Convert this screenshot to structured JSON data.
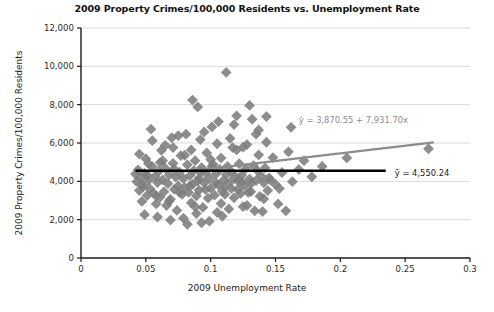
{
  "chart_data": {
    "type": "scatter",
    "title": "2009 Property Crimes/100,000 Residents vs. Unemployment Rate",
    "xlabel": "2009 Unemployment Rate",
    "ylabel": "2009 Property Crimes/100,000 Residents",
    "xlim": [
      0,
      0.3
    ],
    "ylim": [
      0,
      12000
    ],
    "xticks": [
      0,
      0.05,
      0.1,
      0.15,
      0.2,
      0.25,
      0.3
    ],
    "xtick_labels": [
      "0",
      "0.05",
      "0.1",
      "0.15",
      "0.2",
      "0.25",
      "0.3"
    ],
    "yticks": [
      0,
      2000,
      4000,
      6000,
      8000,
      10000,
      12000
    ],
    "ytick_labels": [
      "0",
      "2,000",
      "4,000",
      "6,000",
      "8,000",
      "10,000",
      "12,000"
    ],
    "grid": "horizontal",
    "legend": "none",
    "marker": "diamond",
    "marker_color": "#7d7d7d",
    "marker_size": 5.4,
    "regression_line": {
      "label": "ŷ = 3,870.55 + 7,931.70x",
      "intercept": 3870.55,
      "slope": 7931.7,
      "color": "#8c8c8c",
      "x_start": 0.085,
      "x_end": 0.272,
      "label_x": 0.168,
      "label_y": 7050
    },
    "mean_line": {
      "label": "ȳ = 4,550.24",
      "value": 4550.24,
      "color": "#000000",
      "x_start": 0.042,
      "x_end": 0.235,
      "label_x": 0.242,
      "label_y": 4300
    },
    "points": [
      [
        0.042,
        4380
      ],
      [
        0.043,
        3980
      ],
      [
        0.044,
        4600
      ],
      [
        0.045,
        3520
      ],
      [
        0.046,
        4180
      ],
      [
        0.047,
        2950
      ],
      [
        0.048,
        3720
      ],
      [
        0.049,
        4420
      ],
      [
        0.05,
        5180
      ],
      [
        0.051,
        3260
      ],
      [
        0.052,
        4050
      ],
      [
        0.053,
        3620
      ],
      [
        0.054,
        6720
      ],
      [
        0.055,
        4760
      ],
      [
        0.056,
        3380
      ],
      [
        0.057,
        4250
      ],
      [
        0.058,
        2820
      ],
      [
        0.059,
        3940
      ],
      [
        0.06,
        4520
      ],
      [
        0.061,
        3180
      ],
      [
        0.062,
        5620
      ],
      [
        0.063,
        4080
      ],
      [
        0.064,
        3460
      ],
      [
        0.065,
        4680
      ],
      [
        0.066,
        2740
      ],
      [
        0.067,
        3880
      ],
      [
        0.068,
        4340
      ],
      [
        0.069,
        3060
      ],
      [
        0.07,
        6280
      ],
      [
        0.071,
        4940
      ],
      [
        0.072,
        3580
      ],
      [
        0.073,
        4220
      ],
      [
        0.074,
        2480
      ],
      [
        0.075,
        3760
      ],
      [
        0.076,
        4480
      ],
      [
        0.077,
        5340
      ],
      [
        0.078,
        3320
      ],
      [
        0.079,
        4140
      ],
      [
        0.08,
        3680
      ],
      [
        0.081,
        6460
      ],
      [
        0.082,
        4860
      ],
      [
        0.083,
        3420
      ],
      [
        0.084,
        4300
      ],
      [
        0.085,
        2880
      ],
      [
        0.086,
        3840
      ],
      [
        0.087,
        4560
      ],
      [
        0.088,
        5080
      ],
      [
        0.089,
        3240
      ],
      [
        0.09,
        4020
      ],
      [
        0.091,
        3540
      ],
      [
        0.092,
        6180
      ],
      [
        0.093,
        4720
      ],
      [
        0.094,
        2640
      ],
      [
        0.095,
        3920
      ],
      [
        0.096,
        4440
      ],
      [
        0.097,
        5480
      ],
      [
        0.098,
        3120
      ],
      [
        0.099,
        4160
      ],
      [
        0.1,
        3640
      ],
      [
        0.101,
        6840
      ],
      [
        0.102,
        4880
      ],
      [
        0.103,
        3280
      ],
      [
        0.104,
        4380
      ],
      [
        0.105,
        2380
      ],
      [
        0.106,
        3820
      ],
      [
        0.107,
        4620
      ],
      [
        0.108,
        5220
      ],
      [
        0.109,
        3480
      ],
      [
        0.11,
        4060
      ],
      [
        0.111,
        3700
      ],
      [
        0.112,
        9680
      ],
      [
        0.113,
        4780
      ],
      [
        0.114,
        2560
      ],
      [
        0.115,
        3960
      ],
      [
        0.116,
        4500
      ],
      [
        0.117,
        5760
      ],
      [
        0.118,
        3140
      ],
      [
        0.119,
        4240
      ],
      [
        0.12,
        7420
      ],
      [
        0.121,
        3580
      ],
      [
        0.122,
        4920
      ],
      [
        0.123,
        3360
      ],
      [
        0.124,
        4320
      ],
      [
        0.125,
        2680
      ],
      [
        0.126,
        3780
      ],
      [
        0.127,
        4660
      ],
      [
        0.128,
        5920
      ],
      [
        0.129,
        3420
      ],
      [
        0.13,
        4120
      ],
      [
        0.131,
        3880
      ],
      [
        0.132,
        7240
      ],
      [
        0.133,
        4820
      ],
      [
        0.134,
        2460
      ],
      [
        0.135,
        4040
      ],
      [
        0.136,
        4560
      ],
      [
        0.137,
        5380
      ],
      [
        0.138,
        3220
      ],
      [
        0.139,
        4280
      ],
      [
        0.14,
        2420
      ],
      [
        0.141,
        3920
      ],
      [
        0.142,
        4700
      ],
      [
        0.143,
        6040
      ],
      [
        0.144,
        3520
      ],
      [
        0.145,
        4180
      ],
      [
        0.148,
        5240
      ],
      [
        0.15,
        3840
      ],
      [
        0.152,
        2820
      ],
      [
        0.155,
        4460
      ],
      [
        0.158,
        2460
      ],
      [
        0.16,
        5540
      ],
      [
        0.163,
        3980
      ],
      [
        0.168,
        4620
      ],
      [
        0.047,
        3840
      ],
      [
        0.052,
        4920
      ],
      [
        0.058,
        3240
      ],
      [
        0.063,
        5080
      ],
      [
        0.068,
        2960
      ],
      [
        0.072,
        4640
      ],
      [
        0.076,
        3420
      ],
      [
        0.08,
        5360
      ],
      [
        0.084,
        3760
      ],
      [
        0.088,
        2680
      ],
      [
        0.092,
        4480
      ],
      [
        0.096,
        3580
      ],
      [
        0.1,
        5140
      ],
      [
        0.104,
        3920
      ],
      [
        0.108,
        2840
      ],
      [
        0.112,
        4360
      ],
      [
        0.116,
        3620
      ],
      [
        0.12,
        5640
      ],
      [
        0.124,
        3980
      ],
      [
        0.128,
        2740
      ],
      [
        0.045,
        5420
      ],
      [
        0.055,
        6120
      ],
      [
        0.065,
        5880
      ],
      [
        0.075,
        6380
      ],
      [
        0.085,
        5640
      ],
      [
        0.095,
        6580
      ],
      [
        0.105,
        5960
      ],
      [
        0.115,
        6240
      ],
      [
        0.125,
        5780
      ],
      [
        0.135,
        6460
      ],
      [
        0.086,
        8240
      ],
      [
        0.09,
        7880
      ],
      [
        0.106,
        7120
      ],
      [
        0.118,
        6960
      ],
      [
        0.268,
        5700
      ],
      [
        0.205,
        5220
      ],
      [
        0.186,
        4780
      ],
      [
        0.178,
        4240
      ],
      [
        0.172,
        5080
      ],
      [
        0.162,
        6820
      ],
      [
        0.143,
        7380
      ],
      [
        0.137,
        6680
      ],
      [
        0.13,
        7960
      ],
      [
        0.049,
        2260
      ],
      [
        0.059,
        2140
      ],
      [
        0.069,
        1980
      ],
      [
        0.079,
        2080
      ],
      [
        0.089,
        2320
      ],
      [
        0.099,
        1920
      ],
      [
        0.109,
        2180
      ],
      [
        0.082,
        1760
      ],
      [
        0.093,
        1840
      ],
      [
        0.071,
        5760
      ],
      [
        0.061,
        4980
      ],
      [
        0.051,
        4320
      ],
      [
        0.091,
        4160
      ],
      [
        0.101,
        4780
      ],
      [
        0.111,
        3320
      ],
      [
        0.121,
        4020
      ],
      [
        0.131,
        3460
      ],
      [
        0.141,
        3080
      ],
      [
        0.146,
        4080
      ],
      [
        0.153,
        3620
      ]
    ]
  }
}
